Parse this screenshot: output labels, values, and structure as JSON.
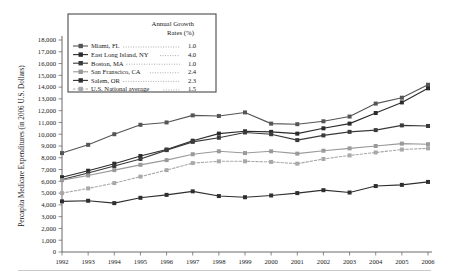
{
  "chart_data": {
    "type": "line",
    "title": "",
    "xlabel": "",
    "ylabel": "Percapita Medicare Expenditures (in 2006 U.S. Dollars)",
    "x": [
      1992,
      1993,
      1994,
      1995,
      1996,
      1997,
      1998,
      1999,
      2000,
      2001,
      2002,
      2003,
      2004,
      2005,
      2006
    ],
    "xtick_labels": [
      "1992",
      "1993",
      "1994",
      "1995",
      "1996",
      "1997",
      "1998",
      "1999",
      "2000",
      "2001",
      "2002",
      "2003",
      "2004",
      "2005",
      "2006"
    ],
    "ylim": [
      0,
      18000
    ],
    "ytick_labels": [
      "0",
      "1,000",
      "2,000",
      "3,000",
      "4,000",
      "5,000",
      "6,000",
      "7,000",
      "8,000",
      "9,000",
      "10,000",
      "11,000",
      "12,000",
      "13,000",
      "14,000",
      "15,000",
      "16,000",
      "17,000",
      "18,000"
    ],
    "ytick_values": [
      0,
      1000,
      2000,
      3000,
      4000,
      5000,
      6000,
      7000,
      8000,
      9000,
      10000,
      11000,
      12000,
      13000,
      14000,
      15000,
      16000,
      17000,
      18000
    ],
    "grid": false,
    "legend_position": "top-left",
    "legend_header_line1": "Annual Growth",
    "legend_header_line2": "Rates (%)",
    "series": [
      {
        "name": "Miami, FL",
        "growth_rate": "1.0",
        "color": "#555555",
        "dashed": false,
        "values": [
          8400,
          9100,
          10000,
          10800,
          11000,
          11600,
          11550,
          11850,
          10900,
          10850,
          11100,
          11500,
          12600,
          13100,
          14200
        ]
      },
      {
        "name": "East Long Island, NY",
        "growth_rate": "4.0",
        "color": "#2b2b2b",
        "dashed": false,
        "values": [
          6350,
          6900,
          7500,
          8150,
          8700,
          9450,
          10050,
          10250,
          10200,
          10050,
          10500,
          10900,
          11800,
          12700,
          13900
        ]
      },
      {
        "name": "Boston, MA",
        "growth_rate": "1.0",
        "color": "#3a3a3a",
        "dashed": false,
        "values": [
          6150,
          6700,
          7300,
          7900,
          8650,
          9350,
          9700,
          10150,
          10000,
          9500,
          9900,
          10200,
          10350,
          10750,
          10700
        ]
      },
      {
        "name": "San Franscico, CA",
        "growth_rate": "2.4",
        "color": "#9a9a9a",
        "dashed": false,
        "values": [
          6100,
          6500,
          6950,
          7400,
          7800,
          8300,
          8550,
          8400,
          8550,
          8350,
          8600,
          8800,
          9000,
          9200,
          9150
        ]
      },
      {
        "name": "Salem, OR",
        "growth_rate": "2.3",
        "color": "#2f2f2f",
        "dashed": false,
        "values": [
          4300,
          4350,
          4150,
          4600,
          4850,
          5150,
          4750,
          4650,
          4800,
          5000,
          5250,
          5050,
          5600,
          5700,
          5950
        ]
      },
      {
        "name": "U.S. National average",
        "growth_rate": "1.5",
        "color": "#a8a8a8",
        "dashed": true,
        "values": [
          5000,
          5400,
          5850,
          6400,
          6950,
          7550,
          7700,
          7700,
          7650,
          7500,
          7900,
          8200,
          8450,
          8700,
          8800
        ]
      }
    ]
  }
}
